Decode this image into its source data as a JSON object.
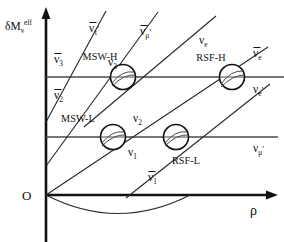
{
  "figure": {
    "name": "neutrino-level-crossing-diagram",
    "axes": {
      "y_label_main": "δM",
      "y_label_sub": "ν",
      "y_label_sup": "eff",
      "x_label": "ρ",
      "origin_label": "O"
    },
    "resonances": [
      {
        "id": "msw-h",
        "label": "MSW-H",
        "cx": 123,
        "cy": 77,
        "r": 12.5
      },
      {
        "id": "rsf-h",
        "label": "RSF-H",
        "cx": 232,
        "cy": 77,
        "r": 12.5
      },
      {
        "id": "msw-l",
        "label": "MSW-L",
        "cx": 113,
        "cy": 137,
        "r": 12.5
      },
      {
        "id": "rsf-l",
        "label": "RSF-L",
        "cx": 176,
        "cy": 137,
        "r": 12.5
      }
    ],
    "branch_labels": [
      {
        "id": "nubar-tau-prime",
        "base": "ν",
        "bar": true,
        "sub": "τ",
        "prime": true,
        "x": 89,
        "y": 32
      },
      {
        "id": "nubar-mu-prime",
        "base": "ν",
        "bar": true,
        "sub": "μ",
        "prime": true,
        "x": 140,
        "y": 35
      },
      {
        "id": "nubar-3",
        "base": "ν",
        "bar": true,
        "sub": "3",
        "prime": false,
        "x": 54,
        "y": 63
      },
      {
        "id": "nu-3",
        "base": "ν",
        "bar": false,
        "sub": "3",
        "prime": false,
        "x": 108,
        "y": 66
      },
      {
        "id": "nu-e",
        "base": "ν",
        "bar": false,
        "sub": "e",
        "prime": false,
        "x": 199,
        "y": 44
      },
      {
        "id": "nubar-e",
        "base": "ν",
        "bar": true,
        "sub": "e",
        "prime": false,
        "x": 253,
        "y": 57
      },
      {
        "id": "nu-e-prime",
        "base": "ν",
        "bar": false,
        "sub": "e",
        "prime": true,
        "x": 253,
        "y": 93
      },
      {
        "id": "nubar-2",
        "base": "ν",
        "bar": true,
        "sub": "2",
        "prime": false,
        "x": 54,
        "y": 99
      },
      {
        "id": "nu-2",
        "base": "ν",
        "bar": false,
        "sub": "2",
        "prime": false,
        "x": 133,
        "y": 122
      },
      {
        "id": "nu-1",
        "base": "ν",
        "bar": false,
        "sub": "1",
        "prime": false,
        "x": 128,
        "y": 156
      },
      {
        "id": "nubar-1",
        "base": "ν",
        "bar": true,
        "sub": "1",
        "prime": false,
        "x": 148,
        "y": 181
      },
      {
        "id": "nu-mu-prime",
        "base": "ν",
        "bar": false,
        "sub": "μ",
        "prime": true,
        "x": 253,
        "y": 152
      }
    ],
    "colors": {
      "axis": "#111111",
      "resonance_line": "#4a4a4a",
      "branch_line": "#2a2a2a",
      "background": "#ffffff"
    }
  },
  "chart_data": {
    "type": "line",
    "title": "",
    "xlabel": "ρ",
    "ylabel": "δM_ν^eff",
    "grid": false,
    "legend": "none",
    "series": [
      {
        "name": "upper resonance level",
        "kind": "horizontal-level",
        "y": 77
      },
      {
        "name": "lower resonance level",
        "kind": "horizontal-level",
        "y": 137
      },
      {
        "name": "nubar_3 -> nubar_tau_prime",
        "kind": "rising-diagonal",
        "points": [
          [
            46,
            120
          ],
          [
            105,
            12
          ]
        ]
      },
      {
        "name": "nubar_2 -> nubar_mu_prime",
        "kind": "rising-diagonal",
        "points": [
          [
            46,
            165
          ],
          [
            156,
            15
          ]
        ]
      },
      {
        "name": "nubar_1 -> nubar_e",
        "kind": "rising-diagonal",
        "points": [
          [
            46,
            195
          ],
          [
            266,
            48
          ]
        ]
      },
      {
        "name": "nu_3 -> nu_e",
        "kind": "rising-diagonal",
        "points": [
          [
            84,
            127
          ],
          [
            214,
            18
          ]
        ]
      },
      {
        "name": "nu_2 -> nu_e_prime",
        "kind": "rising-diagonal",
        "points": [
          [
            124,
            196
          ],
          [
            268,
            83
          ]
        ]
      },
      {
        "name": "nu_1 parabola",
        "kind": "parabola",
        "points": [
          [
            46,
            195
          ],
          [
            118,
            222
          ],
          [
            190,
            195
          ]
        ]
      }
    ],
    "annotations": [
      "MSW-H",
      "RSF-H",
      "MSW-L",
      "RSF-L"
    ]
  }
}
